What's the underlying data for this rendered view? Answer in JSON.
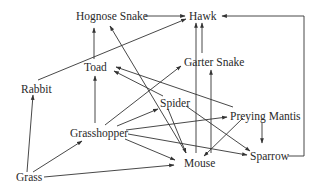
{
  "diagram": {
    "type": "food-web",
    "nodes": [
      {
        "id": "hognose",
        "label": "Hognose Snake",
        "x": 76,
        "y": 11
      },
      {
        "id": "hawk",
        "label": "Hawk",
        "x": 190,
        "y": 11
      },
      {
        "id": "toad",
        "label": "Toad",
        "x": 84,
        "y": 63
      },
      {
        "id": "garter",
        "label": "Garter Snake",
        "x": 184,
        "y": 57
      },
      {
        "id": "rabbit",
        "label": "Rabbit",
        "x": 21,
        "y": 83
      },
      {
        "id": "spider",
        "label": "Spider",
        "x": 160,
        "y": 98
      },
      {
        "id": "mantis",
        "label": "Preying Mantis",
        "x": 230,
        "y": 111
      },
      {
        "id": "grasshopper",
        "label": "Grasshopper",
        "x": 70,
        "y": 128
      },
      {
        "id": "sparrow",
        "label": "Sparrow",
        "x": 250,
        "y": 150
      },
      {
        "id": "mouse",
        "label": "Mouse",
        "x": 184,
        "y": 157
      },
      {
        "id": "grass",
        "label": "Grass",
        "x": 16,
        "y": 172
      }
    ],
    "edges": [
      {
        "from": "Grass",
        "to": "Rabbit"
      },
      {
        "from": "Grass",
        "to": "Grasshopper"
      },
      {
        "from": "Grass",
        "to": "Mouse"
      },
      {
        "from": "Rabbit",
        "to": "Hawk"
      },
      {
        "from": "Grasshopper",
        "to": "Toad"
      },
      {
        "from": "Grasshopper",
        "to": "Garter Snake"
      },
      {
        "from": "Grasshopper",
        "to": "Spider"
      },
      {
        "from": "Grasshopper",
        "to": "Preying Mantis"
      },
      {
        "from": "Grasshopper",
        "to": "Sparrow"
      },
      {
        "from": "Grasshopper",
        "to": "Mouse"
      },
      {
        "from": "Toad",
        "to": "Hognose Snake"
      },
      {
        "from": "Spider",
        "to": "Toad"
      },
      {
        "from": "Spider",
        "to": "Mouse"
      },
      {
        "from": "Spider",
        "to": "Sparrow"
      },
      {
        "from": "Preying Mantis",
        "to": "Toad"
      },
      {
        "from": "Preying Mantis",
        "to": "Mouse"
      },
      {
        "from": "Preying Mantis",
        "to": "Sparrow"
      },
      {
        "from": "Mouse",
        "to": "Hognose Snake"
      },
      {
        "from": "Mouse",
        "to": "Hawk"
      },
      {
        "from": "Mouse",
        "to": "Garter Snake"
      },
      {
        "from": "Garter Snake",
        "to": "Hawk"
      },
      {
        "from": "Hognose Snake",
        "to": "Hawk"
      },
      {
        "from": "Sparrow",
        "to": "Hawk"
      }
    ]
  }
}
